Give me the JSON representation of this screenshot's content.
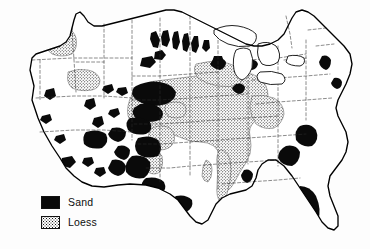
{
  "figure": {
    "type": "thematic-map",
    "region": "Contiguous United States",
    "background_color": "#fdfdfd",
    "outline_color": "#000000",
    "state_border_style": "dashed"
  },
  "legend": {
    "items": [
      {
        "label": "Sand",
        "pattern": "solid-black",
        "color": "#090909"
      },
      {
        "label": "Loess",
        "pattern": "stipple-dots",
        "color": "#1a1a1a"
      }
    ]
  },
  "map_features": {
    "sand_regions": [
      "Nebraska Sand Hills",
      "Dakota dune fields",
      "Texas Panhandle / High Plains",
      "Southwest desert dune fields",
      "Carolina Sandhills",
      "Atlantic coastal plain",
      "Florida sand ridges",
      "Gulf coast Texas"
    ],
    "loess_regions": [
      "Palouse, Washington",
      "Snake River Plain, Idaho",
      "Central Great Plains",
      "Upper Midwest",
      "Mississippi Valley loess belt",
      "Ohio Valley"
    ]
  }
}
